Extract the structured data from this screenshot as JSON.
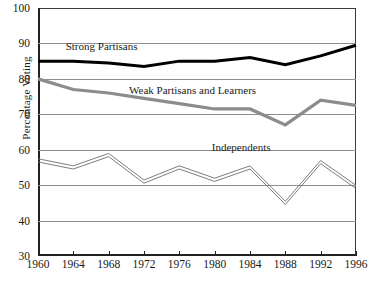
{
  "chart_data": {
    "type": "line",
    "title": "",
    "xlabel": "",
    "ylabel": "Percentage Voting",
    "xlim": [
      1960,
      1996
    ],
    "ylim": [
      30,
      100
    ],
    "yticks": [
      30,
      40,
      50,
      60,
      70,
      80,
      90,
      100
    ],
    "grid": true,
    "legend_position": "inline-annotations",
    "x": [
      1960,
      1964,
      1968,
      1972,
      1976,
      1980,
      1984,
      1988,
      1992,
      1996
    ],
    "xtick_labels": [
      "1960",
      "1964",
      "1968",
      "1972",
      "1976",
      "1980",
      "1984",
      "1988",
      "1992",
      "1996"
    ],
    "ytick_labels": [
      "30",
      "40",
      "50",
      "60",
      "70",
      "80",
      "90",
      "100"
    ],
    "series": [
      {
        "name": "Strong Partisans",
        "color": "#000000",
        "style": "thick-black",
        "values": [
          85,
          85,
          84.5,
          83.5,
          85,
          85,
          86,
          84,
          86.5,
          89.5
        ]
      },
      {
        "name": "Weak Partisans and Learners",
        "color": "#8c8c8c",
        "style": "thick-gray",
        "values": [
          80,
          77,
          76,
          74.5,
          73,
          71.5,
          71.5,
          67,
          74,
          72.5
        ]
      },
      {
        "name": "Independents",
        "color": "#6e6e6e",
        "style": "thin-double",
        "values": [
          57,
          55,
          58.5,
          51,
          55,
          51.5,
          55,
          45,
          56.5,
          49.5
        ]
      }
    ],
    "annotations": [
      {
        "text": "Strong Partisans",
        "x": 1967.2,
        "y": 89.0
      },
      {
        "text": "Weak Partisans and Learners",
        "x": 1977.5,
        "y": 76.5
      },
      {
        "text": "Independents",
        "x": 1983.0,
        "y": 60.5
      }
    ]
  }
}
